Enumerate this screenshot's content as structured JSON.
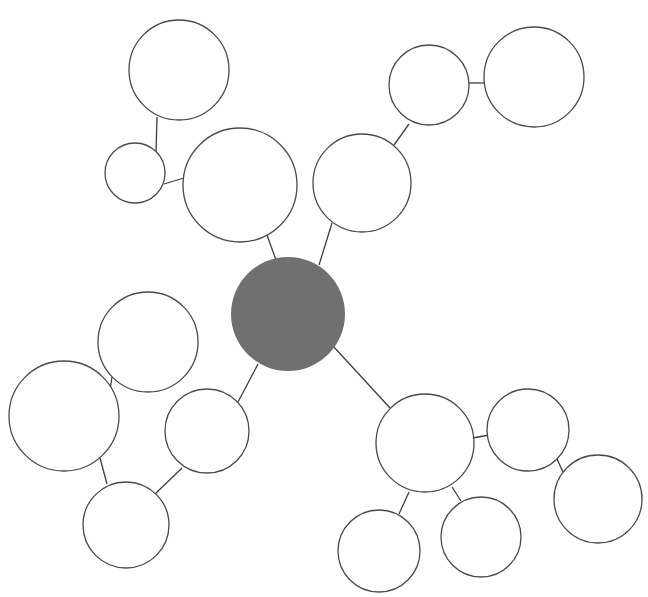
{
  "diagram": {
    "type": "bubble-map",
    "style": {
      "background": "#ffffff",
      "node_fill": "#ffffff",
      "node_stroke": "#4a4a4a",
      "center_fill": "#707070",
      "edge_stroke": "#3f3f3f",
      "stroke_width": 1.3
    },
    "center": {
      "id": "center",
      "cx": 288,
      "cy": 314,
      "r": 57
    },
    "nodes": [
      {
        "id": "A",
        "cx": 179,
        "cy": 70,
        "r": 50
      },
      {
        "id": "B",
        "cx": 135,
        "cy": 173,
        "r": 30
      },
      {
        "id": "C",
        "cx": 240,
        "cy": 185,
        "r": 57
      },
      {
        "id": "D",
        "cx": 429,
        "cy": 85,
        "r": 40
      },
      {
        "id": "E",
        "cx": 534,
        "cy": 77,
        "r": 50
      },
      {
        "id": "F",
        "cx": 362,
        "cy": 183,
        "r": 49
      },
      {
        "id": "G",
        "cx": 148,
        "cy": 342,
        "r": 50
      },
      {
        "id": "H",
        "cx": 64,
        "cy": 416,
        "r": 55
      },
      {
        "id": "I",
        "cx": 207,
        "cy": 431,
        "r": 42
      },
      {
        "id": "J",
        "cx": 126,
        "cy": 525,
        "r": 43
      },
      {
        "id": "K",
        "cx": 425,
        "cy": 443,
        "r": 49
      },
      {
        "id": "L",
        "cx": 528,
        "cy": 430,
        "r": 41
      },
      {
        "id": "M",
        "cx": 598,
        "cy": 499,
        "r": 44
      },
      {
        "id": "N",
        "cx": 379,
        "cy": 551,
        "r": 41
      },
      {
        "id": "O",
        "cx": 481,
        "cy": 537,
        "r": 40
      }
    ],
    "edges": [
      {
        "from": "A",
        "to": "B",
        "x1": 157,
        "y1": 117,
        "x2": 156,
        "y2": 152
      },
      {
        "from": "B",
        "to": "C",
        "x1": 164,
        "y1": 184,
        "x2": 184,
        "y2": 178
      },
      {
        "from": "C",
        "to": "center",
        "x1": 267,
        "y1": 235,
        "x2": 276,
        "y2": 260
      },
      {
        "from": "F",
        "to": "center",
        "x1": 332,
        "y1": 223,
        "x2": 319,
        "y2": 265
      },
      {
        "from": "F",
        "to": "D",
        "x1": 394,
        "y1": 145,
        "x2": 409,
        "y2": 124
      },
      {
        "from": "D",
        "to": "E",
        "x1": 469,
        "y1": 83,
        "x2": 485,
        "y2": 83
      },
      {
        "from": "center",
        "to": "I",
        "x1": 258,
        "y1": 364,
        "x2": 238,
        "y2": 402
      },
      {
        "from": "G",
        "to": "H",
        "x1": 112,
        "y1": 377,
        "x2": 110,
        "y2": 390
      },
      {
        "from": "H",
        "to": "J",
        "x1": 100,
        "y1": 458,
        "x2": 107,
        "y2": 484
      },
      {
        "from": "I",
        "to": "J",
        "x1": 182,
        "y1": 468,
        "x2": 155,
        "y2": 494
      },
      {
        "from": "center",
        "to": "K",
        "x1": 333,
        "y1": 346,
        "x2": 390,
        "y2": 408
      },
      {
        "from": "K",
        "to": "L",
        "x1": 473,
        "y1": 438,
        "x2": 489,
        "y2": 435
      },
      {
        "from": "L",
        "to": "M",
        "x1": 557,
        "y1": 459,
        "x2": 563,
        "y2": 472
      },
      {
        "from": "K",
        "to": "N",
        "x1": 409,
        "y1": 492,
        "x2": 399,
        "y2": 514
      },
      {
        "from": "K",
        "to": "O",
        "x1": 452,
        "y1": 487,
        "x2": 461,
        "y2": 501
      }
    ]
  }
}
